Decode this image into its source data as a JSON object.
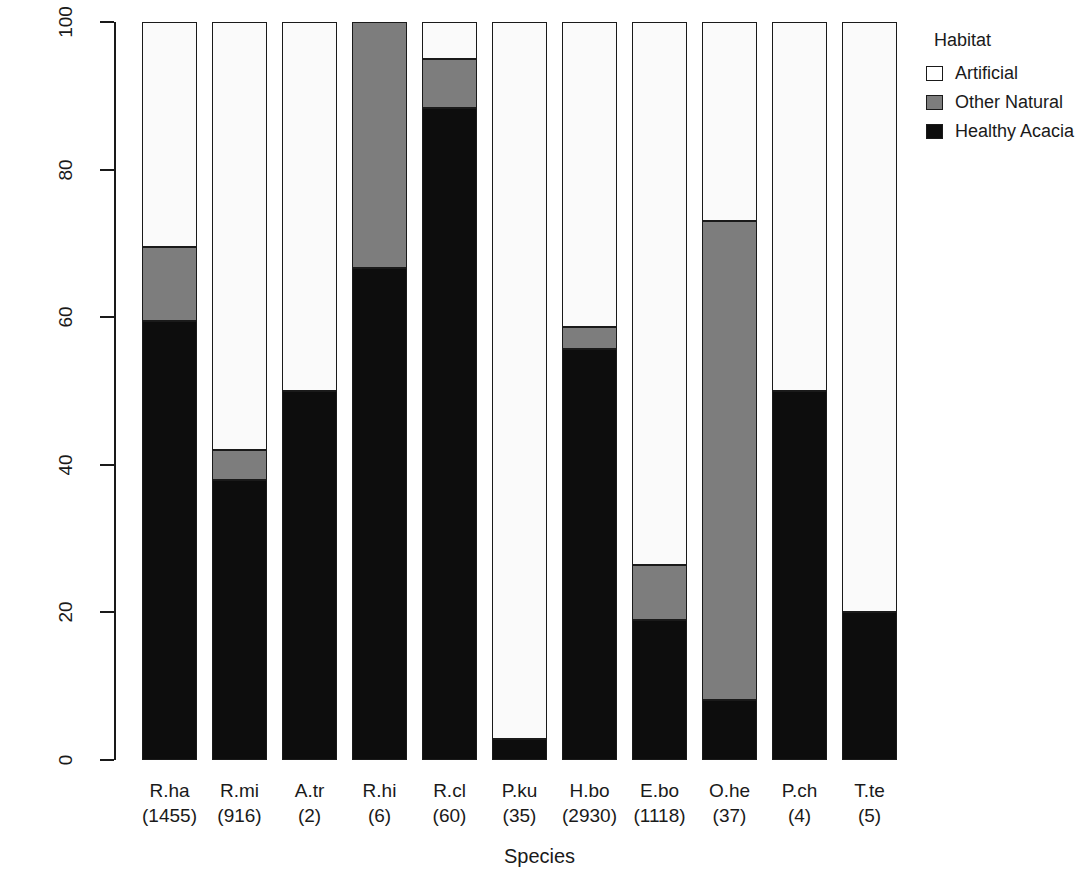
{
  "chart_data": {
    "type": "bar",
    "subtype": "stacked-percent",
    "title": "",
    "xlabel": "Species",
    "ylabel": "Percent of total passes",
    "ylim": [
      0,
      100
    ],
    "yticks": [
      0,
      20,
      40,
      60,
      80,
      100
    ],
    "grid": false,
    "legend": {
      "title": "Habitat",
      "position": "right",
      "entries": [
        {
          "label": "Artificial",
          "color": "#ffffff",
          "key": "artificial"
        },
        {
          "label": "Other Natural",
          "color": "#7d7d7d",
          "key": "other_natural"
        },
        {
          "label": "Healthy Acacia",
          "color": "#0d0d0d",
          "key": "healthy_acacia"
        }
      ]
    },
    "categories": [
      "R.ha",
      "R.mi",
      "A.tr",
      "R.hi",
      "R.cl",
      "P.ku",
      "H.bo",
      "E.bo",
      "O.he",
      "P.ch",
      "T.te"
    ],
    "category_counts": [
      "(1455)",
      "(916)",
      "(2)",
      "(6)",
      "(60)",
      "(35)",
      "(2930)",
      "(1118)",
      "(37)",
      "(4)",
      "(5)"
    ],
    "series": [
      {
        "name": "Healthy Acacia",
        "color": "#0d0d0d",
        "values": [
          59.5,
          38.0,
          50.0,
          66.7,
          88.3,
          2.9,
          55.7,
          19.0,
          8.1,
          50.0,
          20.0
        ]
      },
      {
        "name": "Other Natural",
        "color": "#7d7d7d",
        "values": [
          10.0,
          4.0,
          0.0,
          33.3,
          6.7,
          0.0,
          3.0,
          7.4,
          64.9,
          0.0,
          0.0
        ]
      },
      {
        "name": "Artificial",
        "color": "#ffffff",
        "values": [
          30.5,
          58.0,
          50.0,
          0.0,
          5.0,
          97.1,
          41.3,
          73.6,
          27.0,
          50.0,
          80.0
        ]
      }
    ]
  },
  "axes": {
    "y_title": "Percent of total passes",
    "x_title": "Species",
    "y_tick_labels": [
      "0",
      "20",
      "40",
      "60",
      "80",
      "100"
    ]
  },
  "legend": {
    "title": "Habitat",
    "items": [
      {
        "label": "Artificial"
      },
      {
        "label": "Other Natural"
      },
      {
        "label": "Healthy Acacia"
      }
    ]
  }
}
